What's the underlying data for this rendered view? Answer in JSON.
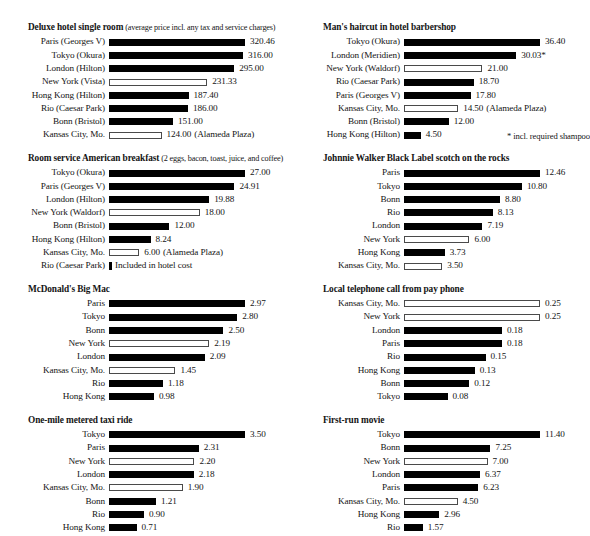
{
  "charts": [
    {
      "id": "deluxe-hotel-single-room",
      "title": "Deluxe hotel single room",
      "subtitle": "(average price incl. any tax and service charges)",
      "column": "left",
      "max_value": 320.46,
      "rows": [
        {
          "label": "Paris (Georges V)",
          "value": 320.46,
          "display": "320.46",
          "style": "filled",
          "note": ""
        },
        {
          "label": "Tokyo (Okura)",
          "value": 316.0,
          "display": "316.00",
          "style": "filled",
          "note": ""
        },
        {
          "label": "London (Hilton)",
          "value": 295.0,
          "display": "295.00",
          "style": "filled",
          "note": ""
        },
        {
          "label": "New York (Vista)",
          "value": 231.33,
          "display": "231.33",
          "style": "hollow",
          "note": ""
        },
        {
          "label": "Hong Kong (Hilton)",
          "value": 187.4,
          "display": "187.40",
          "style": "filled",
          "note": ""
        },
        {
          "label": "Rio (Caesar Park)",
          "value": 186.0,
          "display": "186.00",
          "style": "filled",
          "note": ""
        },
        {
          "label": "Bonn (Bristol)",
          "value": 151.0,
          "display": "151.00",
          "style": "filled",
          "note": ""
        },
        {
          "label": "Kansas City, Mo.",
          "value": 124.0,
          "display": "124.00",
          "style": "hollow",
          "note": "(Alameda Plaza)"
        }
      ]
    },
    {
      "id": "room-service-american-breakfast",
      "title": "Room service American breakfast",
      "subtitle": "(2 eggs, bacon, toast, juice, and coffee)",
      "column": "left",
      "max_value": 27.0,
      "rows": [
        {
          "label": "Tokyo (Okura)",
          "value": 27.0,
          "display": "27.00",
          "style": "filled",
          "note": ""
        },
        {
          "label": "Paris (Georges V)",
          "value": 24.91,
          "display": "24.91",
          "style": "filled",
          "note": ""
        },
        {
          "label": "London (Hilton)",
          "value": 19.88,
          "display": "19.88",
          "style": "filled",
          "note": ""
        },
        {
          "label": "New York (Waldorf)",
          "value": 18.0,
          "display": "18.00",
          "style": "hollow",
          "note": ""
        },
        {
          "label": "Bonn (Bristol)",
          "value": 12.0,
          "display": "12.00",
          "style": "filled",
          "note": ""
        },
        {
          "label": "Hong Kong (Hilton)",
          "value": 8.24,
          "display": "8.24",
          "style": "filled",
          "note": ""
        },
        {
          "label": "Kansas City, Mo.",
          "value": 6.0,
          "display": "6.00",
          "style": "hollow",
          "note": "(Alameda Plaza)"
        },
        {
          "label": "Rio (Caesar Park)",
          "value": 0,
          "display": "",
          "style": "tiny",
          "note": "Included in hotel cost"
        }
      ]
    },
    {
      "id": "mcdonalds-big-mac",
      "title": "McDonald's Big Mac",
      "subtitle": "",
      "column": "left",
      "max_value": 2.97,
      "rows": [
        {
          "label": "Paris",
          "value": 2.97,
          "display": "2.97",
          "style": "filled",
          "note": ""
        },
        {
          "label": "Tokyo",
          "value": 2.8,
          "display": "2.80",
          "style": "filled",
          "note": ""
        },
        {
          "label": "Bonn",
          "value": 2.5,
          "display": "2.50",
          "style": "filled",
          "note": ""
        },
        {
          "label": "New York",
          "value": 2.19,
          "display": "2.19",
          "style": "hollow",
          "note": ""
        },
        {
          "label": "London",
          "value": 2.09,
          "display": "2.09",
          "style": "filled",
          "note": ""
        },
        {
          "label": "Kansas City, Mo.",
          "value": 1.45,
          "display": "1.45",
          "style": "hollow",
          "note": ""
        },
        {
          "label": "Rio",
          "value": 1.18,
          "display": "1.18",
          "style": "filled",
          "note": ""
        },
        {
          "label": "Hong Kong",
          "value": 0.98,
          "display": "0.98",
          "style": "filled",
          "note": ""
        }
      ]
    },
    {
      "id": "one-mile-metered-taxi-ride",
      "title": "One-mile metered taxi ride",
      "subtitle": "",
      "column": "left",
      "max_value": 3.5,
      "rows": [
        {
          "label": "Tokyo",
          "value": 3.5,
          "display": "3.50",
          "style": "filled",
          "note": ""
        },
        {
          "label": "Paris",
          "value": 2.31,
          "display": "2.31",
          "style": "filled",
          "note": ""
        },
        {
          "label": "New York",
          "value": 2.2,
          "display": "2.20",
          "style": "hollow",
          "note": ""
        },
        {
          "label": "London",
          "value": 2.18,
          "display": "2.18",
          "style": "filled",
          "note": ""
        },
        {
          "label": "Kansas City, Mo.",
          "value": 1.9,
          "display": "1.90",
          "style": "hollow",
          "note": ""
        },
        {
          "label": "Bonn",
          "value": 1.21,
          "display": "1.21",
          "style": "filled",
          "note": ""
        },
        {
          "label": "Rio",
          "value": 0.9,
          "display": "0.90",
          "style": "filled",
          "note": ""
        },
        {
          "label": "Hong Kong",
          "value": 0.71,
          "display": "0.71",
          "style": "filled",
          "note": ""
        }
      ]
    },
    {
      "id": "mans-haircut-in-hotel-barbershop",
      "title": "Man's haircut in hotel barbershop",
      "subtitle": "",
      "column": "right",
      "max_value": 36.4,
      "rows": [
        {
          "label": "Tokyo (Okura)",
          "value": 36.4,
          "display": "36.40",
          "style": "filled",
          "note": ""
        },
        {
          "label": "London (Meridien)",
          "value": 30.03,
          "display": "30.03*",
          "style": "filled",
          "note": ""
        },
        {
          "label": "New York (Waldorf)",
          "value": 21.0,
          "display": "21.00",
          "style": "hollow",
          "note": ""
        },
        {
          "label": "Rio (Caesar Park)",
          "value": 18.7,
          "display": "18.70",
          "style": "filled",
          "note": ""
        },
        {
          "label": "Paris (Georges V)",
          "value": 17.8,
          "display": "17.80",
          "style": "filled",
          "note": ""
        },
        {
          "label": "Kansas City, Mo.",
          "value": 14.5,
          "display": "14.50",
          "style": "hollow",
          "note": "(Alameda Plaza)"
        },
        {
          "label": "Bonn (Bristol)",
          "value": 12.0,
          "display": "12.00",
          "style": "filled",
          "note": ""
        },
        {
          "label": "Hong Kong (Hilton)",
          "value": 4.5,
          "display": "4.50",
          "style": "filled",
          "note": ""
        }
      ],
      "footnote": "* incl. required shampoo"
    },
    {
      "id": "johnnie-walker-black-label-scotch",
      "title": "Johnnie Walker Black Label scotch on the rocks",
      "subtitle": "",
      "column": "right",
      "max_value": 12.46,
      "rows": [
        {
          "label": "Paris",
          "value": 12.46,
          "display": "12.46",
          "style": "filled",
          "note": ""
        },
        {
          "label": "Tokyo",
          "value": 10.8,
          "display": "10.80",
          "style": "filled",
          "note": ""
        },
        {
          "label": "Bonn",
          "value": 8.8,
          "display": "8.80",
          "style": "filled",
          "note": ""
        },
        {
          "label": "Rio",
          "value": 8.13,
          "display": "8.13",
          "style": "filled",
          "note": ""
        },
        {
          "label": "London",
          "value": 7.19,
          "display": "7.19",
          "style": "filled",
          "note": ""
        },
        {
          "label": "New York",
          "value": 6.0,
          "display": "6.00",
          "style": "hollow",
          "note": ""
        },
        {
          "label": "Hong Kong",
          "value": 3.73,
          "display": "3.73",
          "style": "filled",
          "note": ""
        },
        {
          "label": "Kansas City, Mo.",
          "value": 3.5,
          "display": "3.50",
          "style": "hollow",
          "note": ""
        }
      ]
    },
    {
      "id": "local-telephone-call-from-pay-phone",
      "title": "Local telephone call from pay phone",
      "subtitle": "",
      "column": "right",
      "max_value": 0.25,
      "rows": [
        {
          "label": "Kansas City, Mo.",
          "value": 0.25,
          "display": "0.25",
          "style": "hollow",
          "note": ""
        },
        {
          "label": "New York",
          "value": 0.25,
          "display": "0.25",
          "style": "hollow",
          "note": ""
        },
        {
          "label": "London",
          "value": 0.18,
          "display": "0.18",
          "style": "filled",
          "note": ""
        },
        {
          "label": "Paris",
          "value": 0.18,
          "display": "0.18",
          "style": "filled",
          "note": ""
        },
        {
          "label": "Rio",
          "value": 0.15,
          "display": "0.15",
          "style": "filled",
          "note": ""
        },
        {
          "label": "Hong Kong",
          "value": 0.13,
          "display": "0.13",
          "style": "filled",
          "note": ""
        },
        {
          "label": "Bonn",
          "value": 0.12,
          "display": "0.12",
          "style": "filled",
          "note": ""
        },
        {
          "label": "Tokyo",
          "value": 0.08,
          "display": "0.08",
          "style": "filled",
          "note": ""
        }
      ]
    },
    {
      "id": "first-run-movie",
      "title": "First-run movie",
      "subtitle": "",
      "column": "right",
      "max_value": 11.4,
      "rows": [
        {
          "label": "Tokyo",
          "value": 11.4,
          "display": "11.40",
          "style": "filled",
          "note": ""
        },
        {
          "label": "Bonn",
          "value": 7.25,
          "display": "7.25",
          "style": "filled",
          "note": ""
        },
        {
          "label": "New York",
          "value": 7.0,
          "display": "7.00",
          "style": "hollow",
          "note": ""
        },
        {
          "label": "London",
          "value": 6.37,
          "display": "6.37",
          "style": "filled",
          "note": ""
        },
        {
          "label": "Paris",
          "value": 6.23,
          "display": "6.23",
          "style": "filled",
          "note": ""
        },
        {
          "label": "Kansas City, Mo.",
          "value": 4.5,
          "display": "4.50",
          "style": "hollow",
          "note": ""
        },
        {
          "label": "Hong Kong",
          "value": 2.96,
          "display": "2.96",
          "style": "filled",
          "note": ""
        },
        {
          "label": "Rio",
          "value": 1.57,
          "display": "1.57",
          "style": "filled",
          "note": ""
        }
      ]
    }
  ],
  "chart_data": [
    {
      "type": "bar",
      "title": "Deluxe hotel single room (average price incl. any tax and service charges)",
      "orientation": "horizontal",
      "categories": [
        "Paris (Georges V)",
        "Tokyo (Okura)",
        "London (Hilton)",
        "New York (Vista)",
        "Hong Kong (Hilton)",
        "Rio (Caesar Park)",
        "Bonn (Bristol)",
        "Kansas City, Mo."
      ],
      "values": [
        320.46,
        316.0,
        295.0,
        231.33,
        187.4,
        186.0,
        151.0,
        124.0
      ],
      "xlabel": "",
      "ylabel": "",
      "xlim": [
        0,
        320.46
      ],
      "grid": false,
      "legend": "none"
    },
    {
      "type": "bar",
      "title": "Room service American breakfast (2 eggs, bacon, toast, juice, and coffee)",
      "orientation": "horizontal",
      "categories": [
        "Tokyo (Okura)",
        "Paris (Georges V)",
        "London (Hilton)",
        "New York (Waldorf)",
        "Bonn (Bristol)",
        "Hong Kong (Hilton)",
        "Kansas City, Mo.",
        "Rio (Caesar Park)"
      ],
      "values": [
        27.0,
        24.91,
        19.88,
        18.0,
        12.0,
        8.24,
        6.0,
        null
      ],
      "xlabel": "",
      "ylabel": "",
      "xlim": [
        0,
        27.0
      ],
      "grid": false,
      "legend": "none"
    },
    {
      "type": "bar",
      "title": "McDonald's Big Mac",
      "orientation": "horizontal",
      "categories": [
        "Paris",
        "Tokyo",
        "Bonn",
        "New York",
        "London",
        "Kansas City, Mo.",
        "Rio",
        "Hong Kong"
      ],
      "values": [
        2.97,
        2.8,
        2.5,
        2.19,
        2.09,
        1.45,
        1.18,
        0.98
      ],
      "xlabel": "",
      "ylabel": "",
      "xlim": [
        0,
        2.97
      ],
      "grid": false,
      "legend": "none"
    },
    {
      "type": "bar",
      "title": "One-mile metered taxi ride",
      "orientation": "horizontal",
      "categories": [
        "Tokyo",
        "Paris",
        "New York",
        "London",
        "Kansas City, Mo.",
        "Bonn",
        "Rio",
        "Hong Kong"
      ],
      "values": [
        3.5,
        2.31,
        2.2,
        2.18,
        1.9,
        1.21,
        0.9,
        0.71
      ],
      "xlabel": "",
      "ylabel": "",
      "xlim": [
        0,
        3.5
      ],
      "grid": false,
      "legend": "none"
    },
    {
      "type": "bar",
      "title": "Man's haircut in hotel barbershop",
      "orientation": "horizontal",
      "categories": [
        "Tokyo (Okura)",
        "London (Meridien)",
        "New York (Waldorf)",
        "Rio (Caesar Park)",
        "Paris (Georges V)",
        "Kansas City, Mo.",
        "Bonn (Bristol)",
        "Hong Kong (Hilton)"
      ],
      "values": [
        36.4,
        30.03,
        21.0,
        18.7,
        17.8,
        14.5,
        12.0,
        4.5
      ],
      "xlabel": "",
      "ylabel": "",
      "xlim": [
        0,
        36.4
      ],
      "grid": false,
      "legend": "none"
    },
    {
      "type": "bar",
      "title": "Johnnie Walker Black Label scotch on the rocks",
      "orientation": "horizontal",
      "categories": [
        "Paris",
        "Tokyo",
        "Bonn",
        "Rio",
        "London",
        "New York",
        "Hong Kong",
        "Kansas City, Mo."
      ],
      "values": [
        12.46,
        10.8,
        8.8,
        8.13,
        7.19,
        6.0,
        3.73,
        3.5
      ],
      "xlabel": "",
      "ylabel": "",
      "xlim": [
        0,
        12.46
      ],
      "grid": false,
      "legend": "none"
    },
    {
      "type": "bar",
      "title": "Local telephone call from pay phone",
      "orientation": "horizontal",
      "categories": [
        "Kansas City, Mo.",
        "New York",
        "London",
        "Paris",
        "Rio",
        "Hong Kong",
        "Bonn",
        "Tokyo"
      ],
      "values": [
        0.25,
        0.25,
        0.18,
        0.18,
        0.15,
        0.13,
        0.12,
        0.08
      ],
      "xlabel": "",
      "ylabel": "",
      "xlim": [
        0,
        0.25
      ],
      "grid": false,
      "legend": "none"
    },
    {
      "type": "bar",
      "title": "First-run movie",
      "orientation": "horizontal",
      "categories": [
        "Tokyo",
        "Bonn",
        "New York",
        "London",
        "Paris",
        "Kansas City, Mo.",
        "Hong Kong",
        "Rio"
      ],
      "values": [
        11.4,
        7.25,
        7.0,
        6.37,
        6.23,
        4.5,
        2.96,
        1.57
      ],
      "xlabel": "",
      "ylabel": "",
      "xlim": [
        0,
        11.4
      ],
      "grid": false,
      "legend": "none"
    }
  ]
}
